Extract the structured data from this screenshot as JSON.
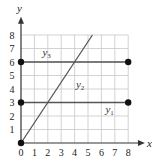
{
  "chart_data": {
    "type": "line",
    "title": "",
    "xlabel": "x",
    "ylabel": "y",
    "xlim": [
      0,
      8
    ],
    "ylim": [
      0,
      8
    ],
    "x_ticks": [
      "0",
      "1",
      "2",
      "3",
      "4",
      "5",
      "6",
      "7",
      "8"
    ],
    "y_ticks": [
      "1",
      "2",
      "3",
      "4",
      "5",
      "6",
      "7",
      "8"
    ],
    "grid": true,
    "series": [
      {
        "name": "y1",
        "label": "y",
        "sub": "1",
        "points": [
          [
            0,
            3
          ],
          [
            8,
            3
          ]
        ],
        "endpoints_marked": true
      },
      {
        "name": "y2",
        "label": "y",
        "sub": "2",
        "points": [
          [
            0,
            0
          ],
          [
            5.33,
            8
          ]
        ],
        "equation_hint": "slope 1.5"
      },
      {
        "name": "y3",
        "label": "y",
        "sub": "3",
        "points": [
          [
            0,
            6
          ],
          [
            8,
            6
          ]
        ],
        "endpoints_marked": true
      }
    ],
    "marked_points": [
      [
        0,
        0
      ],
      [
        0,
        3
      ],
      [
        8,
        3
      ],
      [
        0,
        6
      ],
      [
        8,
        6
      ]
    ],
    "colors": {
      "grid": "#c8c8c8",
      "axis": "#333333",
      "line": "#555555",
      "point": "#111111"
    }
  }
}
